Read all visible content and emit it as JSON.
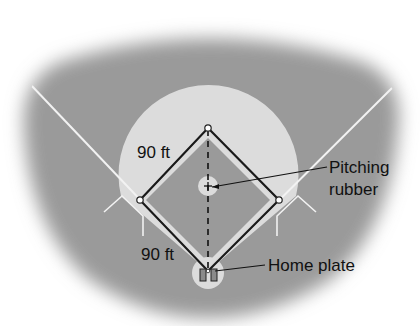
{
  "diagram": {
    "labels": {
      "top_side": "90 ft",
      "bottom_side": "90 ft",
      "pitching_line1": "Pitching",
      "pitching_line2": "rubber",
      "home_plate": "Home plate"
    },
    "colors": {
      "outfield": "#9a9a9a",
      "infield_dirt": "#dcdcdc",
      "infield_grass": "#9a9a9a",
      "lines": "#f2f2f2",
      "base_path": "#1a1a1a",
      "background": "#ffffff"
    },
    "bases": [
      "second",
      "first",
      "third",
      "home"
    ]
  }
}
